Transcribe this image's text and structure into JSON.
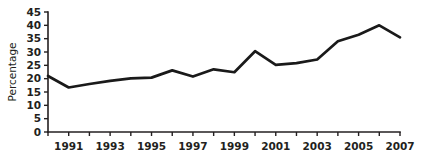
{
  "chart_data": {
    "type": "line",
    "title": "",
    "subtitle": "",
    "xlabel": "",
    "ylabel": "Percentage",
    "xlim": [
      1990,
      2007
    ],
    "ylim": [
      0,
      45
    ],
    "grid": false,
    "legend": false,
    "legend_position": "none",
    "line_color": "#1a1a1a",
    "x": [
      1990,
      1991,
      1992,
      1993,
      1994,
      1995,
      1996,
      1997,
      1998,
      1999,
      2000,
      2001,
      2002,
      2003,
      2004,
      2005,
      2006,
      2007
    ],
    "values": [
      21.0,
      16.7,
      18.0,
      19.2,
      20.1,
      20.4,
      23.1,
      20.8,
      23.5,
      22.4,
      30.3,
      25.2,
      25.8,
      27.2,
      34.0,
      36.5,
      40.0,
      35.5
    ],
    "series": [
      {
        "name": "Percentage",
        "values": [
          21.0,
          16.7,
          18.0,
          19.2,
          20.1,
          20.4,
          23.1,
          20.8,
          23.5,
          22.4,
          30.3,
          25.2,
          25.8,
          27.2,
          34.0,
          36.5,
          40.0,
          35.5
        ]
      }
    ],
    "y_ticks": [
      0,
      5,
      10,
      15,
      20,
      25,
      30,
      35,
      40,
      45
    ],
    "y_tick_labels": [
      "0",
      "5",
      "10",
      "15",
      "20",
      "25",
      "30",
      "35",
      "40",
      "45"
    ],
    "x_ticks": [
      1990,
      1991,
      1992,
      1993,
      1994,
      1995,
      1996,
      1997,
      1998,
      1999,
      2000,
      2001,
      2002,
      2003,
      2004,
      2005,
      2006,
      2007
    ],
    "x_tick_labels_shown": [
      "1991",
      "1993",
      "1995",
      "1997",
      "1999",
      "2001",
      "2003",
      "2005",
      "2007"
    ],
    "x_labeled_ticks": [
      1991,
      1993,
      1995,
      1997,
      1999,
      2001,
      2003,
      2005,
      2007
    ],
    "annotations": []
  },
  "axes": {
    "y_axis_title": "Percentage"
  }
}
